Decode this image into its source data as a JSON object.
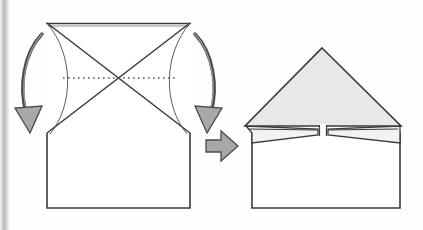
{
  "figure": {
    "title": "Paper folding step: fold both upper side corners down to the centre",
    "caption": "",
    "background_color": "#fefefe",
    "scan_edge_color": "#b9b9b9"
  },
  "style": {
    "line_color": "#3a3a3a",
    "fold_line_color": "#555555",
    "paper_fill": "#ffffff",
    "flap_fill": "#e8e8e8",
    "arrow_fill": "#a8a8a8",
    "arrow_stroke": "#4a4a4a",
    "stroke_width": 1.4
  },
  "panels": [
    {
      "id": "before",
      "name": "unfolded-sheet",
      "label": "Unfolded sheet with crease guides",
      "shapes": {
        "sheet": {
          "name": "paper-outline",
          "points": "47,23 190,23 190,133 190,208 47,208 47,133",
          "description": "Tall rectangle of paper"
        },
        "lower_body": {
          "name": "lower-rectangle",
          "points": "47,133 190,133 190,208 47,208"
        },
        "diagonal_a": {
          "name": "diagonal-crease-left-to-right",
          "x1": 47,
          "y1": 23,
          "x2": 190,
          "y2": 133
        },
        "diagonal_b": {
          "name": "diagonal-crease-right-to-left",
          "x1": 190,
          "y1": 23,
          "x2": 47,
          "y2": 133
        },
        "top_edge": {
          "name": "top-edge",
          "x1": 47,
          "y1": 23,
          "x2": 190,
          "y2": 23
        },
        "dotted_fold": {
          "name": "horizontal-fold-line",
          "x1": 63,
          "y1": 78,
          "x2": 175,
          "y2": 78,
          "dash": "1.6 3.4"
        }
      },
      "arrows": [
        {
          "name": "fold-arrow-left",
          "direction": "down",
          "path": "M 40,33 C 22,52 18,90 26,118",
          "head": "30,134 16,112 41,110",
          "description": "Curved arrow showing left corner folding down"
        },
        {
          "name": "fold-arrow-right",
          "direction": "down",
          "path": "M 196,33 C 214,52 218,90 210,118",
          "head": "206,134 195,110 220,112",
          "description": "Curved arrow showing right corner folding down"
        }
      ]
    },
    {
      "id": "transition",
      "name": "transition-arrow",
      "label": "becomes",
      "arrow": {
        "name": "right-block-arrow",
        "points": "206,140 221,140 221,132 236,146 221,160 221,152 206,152",
        "direction": "right"
      }
    },
    {
      "id": "after",
      "name": "folded-sheet",
      "label": "Result: both corners folded to form a triangular top",
      "shapes": {
        "lower_body": {
          "name": "lower-rectangle",
          "points": "252,137 400,137 400,208 252,208"
        },
        "big_triangle": {
          "name": "folded-triangle-top",
          "points": "322,48 400,126 246,126",
          "fill": "#e8e8e8"
        },
        "left_flap": {
          "name": "left-flap",
          "points": "246,126 318,128 318,134 252,142 252,137",
          "fill": "#f2f2f2"
        },
        "right_flap": {
          "name": "right-flap",
          "points": "400,126 328,128 328,134 400,142 400,137",
          "fill": "#f2f2f2"
        },
        "center_notch": {
          "name": "center-notch",
          "x": 319,
          "y": 124,
          "width": 8,
          "height": 13
        }
      }
    }
  ]
}
